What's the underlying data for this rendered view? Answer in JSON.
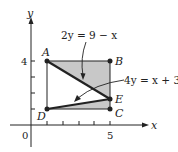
{
  "figure": {
    "axis_x_label": "x",
    "axis_y_label": "y",
    "origin_label": "0",
    "x_tick_label": "5",
    "y_tick_label": "4",
    "points": [
      {
        "name": "A",
        "x": 1,
        "y": 4
      },
      {
        "name": "B",
        "x": 5,
        "y": 4
      },
      {
        "name": "C",
        "x": 5,
        "y": 1
      },
      {
        "name": "D",
        "x": 1,
        "y": 1
      },
      {
        "name": "E",
        "x": 5,
        "y": 2
      }
    ],
    "point_labels": {
      "A": "A",
      "B": "B",
      "C": "C",
      "D": "D",
      "E": "E"
    },
    "equations": {
      "line_AE": "2y = 9 − x",
      "line_DE": "4y = x + 3"
    },
    "colors": {
      "shading": "#c8c8c8",
      "lines": "#222222",
      "background": "#ffffff"
    }
  }
}
